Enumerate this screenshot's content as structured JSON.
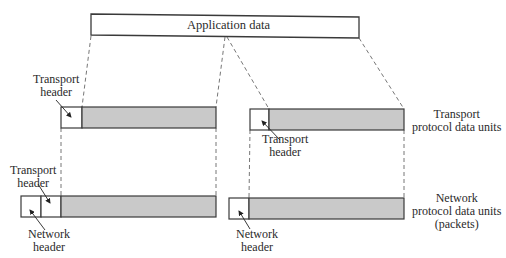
{
  "diagram": {
    "type": "encapsulation",
    "colors": {
      "payload_fill": "#c9c9c9",
      "stroke": "#3a3a3a",
      "dash": "#555555"
    },
    "top_block": {
      "label": "Application data"
    },
    "rows": [
      {
        "name": "transport",
        "side_label_line1": "Transport",
        "side_label_line2": "protocol data units",
        "left_header_label_line1": "Transport",
        "left_header_label_line2": "header",
        "right_header_label_line1": "Transport",
        "right_header_label_line2": "header"
      },
      {
        "name": "network",
        "side_label_line1": "Network",
        "side_label_line2": "protocol data units",
        "side_label_line3": "(packets)",
        "left_transport_label_line1": "Transport",
        "left_transport_label_line2": "header",
        "left_network_label_line1": "Network",
        "left_network_label_line2": "header",
        "right_network_label_line1": "Network",
        "right_network_label_line2": "header"
      }
    ]
  }
}
